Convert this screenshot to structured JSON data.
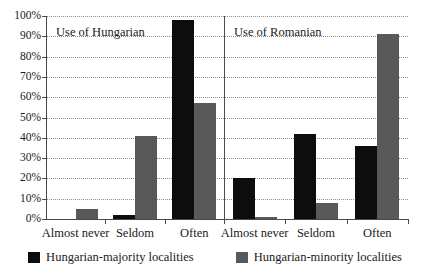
{
  "chart_data": {
    "type": "bar",
    "title": "",
    "subtitle": "",
    "xlabel": "",
    "ylabel": "",
    "ylim": [
      0,
      100
    ],
    "y_tick_labels": [
      "0%",
      "10%",
      "20%",
      "30%",
      "40%",
      "50%",
      "60%",
      "70%",
      "80%",
      "90%",
      "100%"
    ],
    "y_tick_values": [
      0,
      10,
      20,
      30,
      40,
      50,
      60,
      70,
      80,
      90,
      100
    ],
    "grid": "horizontal-dotted",
    "legend_position": "bottom-center",
    "categories": [
      "Almost never",
      "Seldom",
      "Often"
    ],
    "series": [
      {
        "name": "Hungarian-majority localities",
        "color": "#0d0d0d"
      },
      {
        "name": "Hungarian-minority localities",
        "color": "#595959"
      }
    ],
    "panels": [
      {
        "title": "Use of Hungarian",
        "categories": [
          "Almost never",
          "Seldom",
          "Often"
        ],
        "series": [
          {
            "name": "Hungarian-majority localities",
            "values": [
              0,
              2,
              98
            ]
          },
          {
            "name": "Hungarian-minority localities",
            "values": [
              5,
              41,
              57
            ]
          }
        ]
      },
      {
        "title": "Use of Romanian",
        "categories": [
          "Almost never",
          "Seldom",
          "Often"
        ],
        "series": [
          {
            "name": "Hungarian-majority localities",
            "values": [
              20,
              42,
              36
            ]
          },
          {
            "name": "Hungarian-minority localities",
            "values": [
              1,
              8,
              91
            ]
          }
        ]
      }
    ]
  },
  "legend": {
    "items": [
      {
        "label": "Hungarian-majority localities",
        "swatch": "majority"
      },
      {
        "label": "Hungarian-minority localities",
        "swatch": "minority"
      }
    ]
  }
}
